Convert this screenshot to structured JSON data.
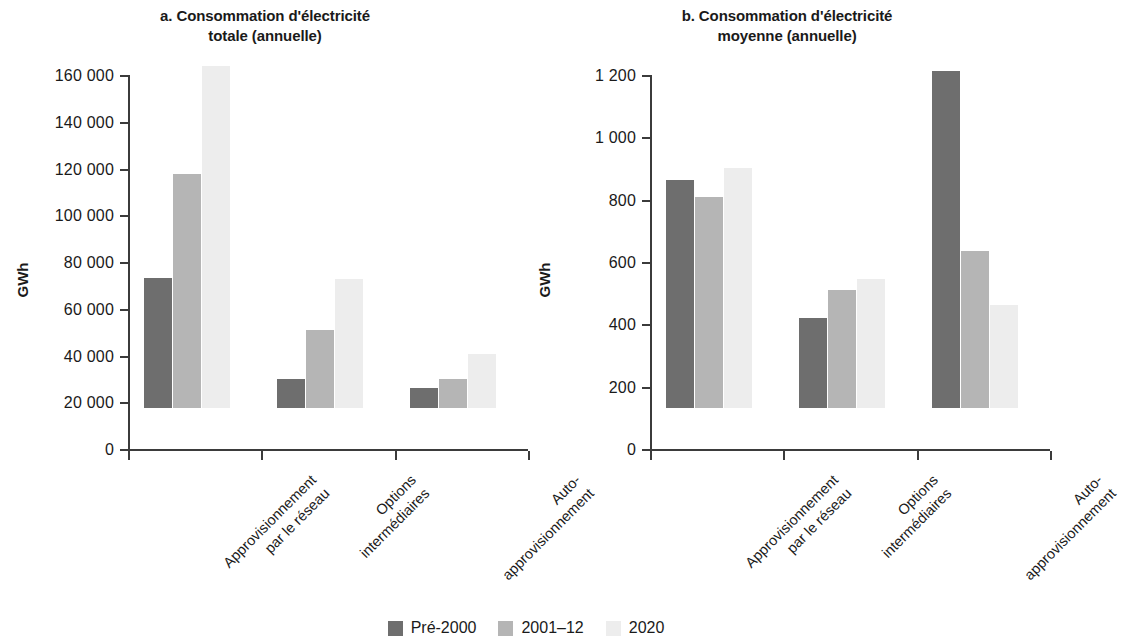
{
  "figure": {
    "series_colors": {
      "pre2000": "#6e6e6e",
      "y2001_12": "#b5b5b5",
      "y2020": "#ededed"
    },
    "axis_color": "#3b3b3b"
  },
  "legend": {
    "items": [
      {
        "label": "Pré-2000",
        "color": "#6e6e6e",
        "swatch_name": "legend-swatch-pre-2000"
      },
      {
        "label": "2001–12",
        "color": "#b5b5b5",
        "swatch_name": "legend-swatch-2001-12"
      },
      {
        "label": "2020",
        "color": "#ededed",
        "swatch_name": "legend-swatch-2020"
      }
    ]
  },
  "panel_a": {
    "title_line1": "a. Consommation d'électricité",
    "title_line2": "totale (annuelle)",
    "ylabel": "GWh",
    "ytick_labels": [
      "160 000",
      "140 000",
      "120 000",
      "100 000",
      "80 000",
      "60 000",
      "40 000",
      "20 000",
      "0"
    ],
    "categories": [
      {
        "line1": "Approvisionnement",
        "line2": "par le réseau"
      },
      {
        "line1": "Options",
        "line2": "intermédiaires"
      },
      {
        "line1": "Auto-",
        "line2": "approvisionnement"
      }
    ]
  },
  "panel_b": {
    "title_line1": "b. Consommation d'électricité",
    "title_line2": "moyenne (annuelle)",
    "ylabel": "GWh",
    "ytick_labels": [
      "1 200",
      "1 000",
      "800",
      "600",
      "400",
      "200",
      "0"
    ],
    "categories": [
      {
        "line1": "Approvisionnement",
        "line2": "par le réseau"
      },
      {
        "line1": "Options",
        "line2": "intermédiaires"
      },
      {
        "line1": "Auto-",
        "line2": "approvisionnement"
      }
    ]
  },
  "chart_data": [
    {
      "type": "bar",
      "panel": "a",
      "title": "a. Consommation d'électricité totale (annuelle)",
      "xlabel": "",
      "ylabel": "GWh",
      "ylim": [
        0,
        160000
      ],
      "ytick_values": [
        0,
        20000,
        40000,
        60000,
        80000,
        100000,
        120000,
        140000,
        160000
      ],
      "grid": false,
      "legend_position": "bottom-center",
      "categories": [
        "Approvisionnement par le réseau",
        "Options intermédiaires",
        "Auto-approvisionnement"
      ],
      "series": [
        {
          "name": "Pré-2000",
          "color": "#6e6e6e",
          "values": [
            55800,
            12400,
            8600
          ]
        },
        {
          "name": "2001–12",
          "color": "#b5b5b5",
          "values": [
            100000,
            33200,
            12200
          ]
        },
        {
          "name": "2020",
          "color": "#ededed",
          "values": [
            146500,
            55000,
            23200
          ]
        }
      ]
    },
    {
      "type": "bar",
      "panel": "b",
      "title": "b. Consommation d'électricité moyenne (annuelle)",
      "xlabel": "",
      "ylabel": "GWh",
      "ylim": [
        0,
        1200
      ],
      "ytick_values": [
        0,
        200,
        400,
        600,
        800,
        1000,
        1200
      ],
      "grid": false,
      "legend_position": "bottom-center",
      "categories": [
        "Approvisionnement par le réseau",
        "Options intermédiaires",
        "Auto-approvisionnement"
      ],
      "series": [
        {
          "name": "Pré-2000",
          "color": "#6e6e6e",
          "values": [
            733,
            290,
            1080
          ]
        },
        {
          "name": "2001–12",
          "color": "#b5b5b5",
          "values": [
            678,
            378,
            505
          ]
        },
        {
          "name": "2020",
          "color": "#ededed",
          "values": [
            770,
            415,
            330
          ]
        }
      ]
    }
  ]
}
